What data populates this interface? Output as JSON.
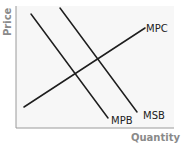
{
  "diagram": {
    "type": "economics-externality",
    "axes": {
      "y_label": "Price",
      "x_label": "Quantity"
    },
    "curves": [
      {
        "id": "mpb",
        "label": "MPB",
        "meaning": "Marginal Private Benefit",
        "slope": "downward",
        "x1": 31,
        "y1": 14,
        "x2": 108,
        "y2": 118
      },
      {
        "id": "msb",
        "label": "MSB",
        "meaning": "Marginal Social Benefit",
        "slope": "downward",
        "x1": 60,
        "y1": 8,
        "x2": 137,
        "y2": 112
      },
      {
        "id": "mpc",
        "label": "MPC",
        "meaning": "Marginal Private Cost",
        "slope": "upward",
        "x1": 24,
        "y1": 107,
        "x2": 145,
        "y2": 28
      }
    ],
    "colors": {
      "background": "#ffffff",
      "plot_area": "#f7f7f7",
      "curve": "#1e1e1e",
      "axis": "#9a9a9a",
      "axis_label": "#8a8a8a"
    }
  }
}
